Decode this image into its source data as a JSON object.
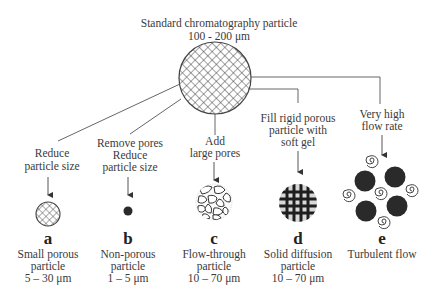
{
  "title": {
    "line1": "Standard chromatography particle",
    "line2": "100 - 200 μm"
  },
  "branches": [
    {
      "id": "a",
      "action": [
        "Reduce",
        "particle size"
      ],
      "letter": "a",
      "description": [
        "Small porous",
        "particle",
        "5 – 30 μm"
      ],
      "particle_icon": "small-crosshatch-particle-icon"
    },
    {
      "id": "b",
      "action": [
        "Remove pores",
        "Reduce",
        "particle size"
      ],
      "letter": "b",
      "description": [
        "Non-porous",
        "particle",
        "1 – 5 μm"
      ],
      "particle_icon": "solid-dot-particle-icon"
    },
    {
      "id": "c",
      "action": [
        "Add",
        "large pores"
      ],
      "letter": "c",
      "description": [
        "Flow-through",
        "particle",
        "10 – 70 μm"
      ],
      "particle_icon": "large-pore-particle-icon"
    },
    {
      "id": "d",
      "action": [
        "Fill rigid porous",
        "particle with",
        "soft gel"
      ],
      "letter": "d",
      "description": [
        "Solid diffusion",
        "particle",
        "10 – 70 μm"
      ],
      "particle_icon": "gel-filled-grid-particle-icon"
    },
    {
      "id": "e",
      "action": [
        "Very high",
        "flow rate"
      ],
      "letter": "e",
      "description": [
        "Turbulent flow"
      ],
      "particle_icon": "turbulent-flow-particles-icon"
    }
  ],
  "colors": {
    "line": "#555555",
    "text": "#3a3a3a",
    "particle_dark": "#2a2a2a",
    "gel_fill": "#d8d8d8"
  }
}
